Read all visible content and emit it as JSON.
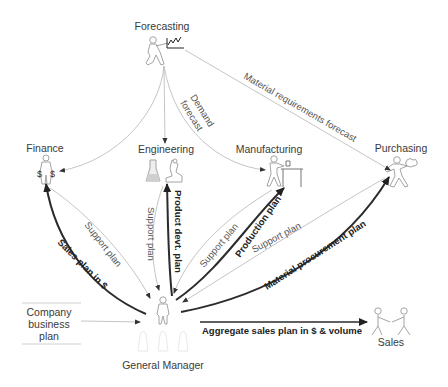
{
  "diagram": {
    "nodes": {
      "forecasting": {
        "label": "Forecasting",
        "icon": "person-with-chart-icon"
      },
      "finance": {
        "label": "Finance",
        "icon": "person-with-money-bags-icon"
      },
      "engineering": {
        "label": "Engineering",
        "icon": "flask-and-microscope-icon"
      },
      "manufacturing": {
        "label": "Manufacturing",
        "icon": "person-at-workbench-icon"
      },
      "purchasing": {
        "label": "Purchasing",
        "icon": "person-carrying-goods-icon"
      },
      "general_manager": {
        "label": "General Manager",
        "icon": "manager-person-icon"
      },
      "sales": {
        "label": "Sales",
        "icon": "handshake-people-icon"
      },
      "company_business_plan": {
        "line1": "Company",
        "line2": "business",
        "line3": "plan"
      }
    },
    "edges": {
      "demand_forecast": {
        "line1": "Demand",
        "line2": "forecast",
        "from": "Forecasting",
        "to": "Manufacturing",
        "weight": "thin"
      },
      "material_requirements_forecast": {
        "label": "Material requirements forecast",
        "from": "Forecasting",
        "to": "Purchasing",
        "weight": "thin"
      },
      "forecast_to_finance": {
        "from": "Forecasting",
        "to": "Finance",
        "weight": "thin"
      },
      "forecast_to_engineering": {
        "from": "Forecasting",
        "to": "Engineering",
        "weight": "thin"
      },
      "finance_support_plan": {
        "label": "Support plan",
        "from": "Finance",
        "to": "General Manager",
        "weight": "thin"
      },
      "sales_plan_in_dollars": {
        "label": "Sales plan in $",
        "from": "General Manager",
        "to": "Finance",
        "weight": "thick"
      },
      "engineering_support_plan": {
        "label": "Support plan",
        "from": "Engineering",
        "to": "General Manager",
        "weight": "thin"
      },
      "product_devt_plan": {
        "label": "Product devt. plan",
        "from": "General Manager",
        "to": "Engineering",
        "weight": "thick"
      },
      "manufacturing_support_plan": {
        "label": "Support plan",
        "from": "Manufacturing",
        "to": "General Manager",
        "weight": "thin"
      },
      "production_plan": {
        "label": "Production plan",
        "from": "General Manager",
        "to": "Manufacturing",
        "weight": "thick"
      },
      "purchasing_support_plan": {
        "label": "Support plan",
        "from": "Purchasing",
        "to": "General Manager",
        "weight": "thin"
      },
      "material_procurement_plan": {
        "label": "Material procurement plan",
        "from": "General Manager",
        "to": "Purchasing",
        "weight": "thick"
      },
      "aggregate_sales_plan": {
        "label": "Aggregate sales plan in $ & volume",
        "from": "General Manager",
        "to": "Sales",
        "weight": "thick"
      },
      "company_plan_input": {
        "from": "Company business plan",
        "to": "General Manager",
        "weight": "thin"
      }
    },
    "colors": {
      "thin_edge": "#bdbdbd",
      "thick_edge": "#2b2b2b",
      "text": "#3a3a3a",
      "background": "#ffffff"
    }
  }
}
